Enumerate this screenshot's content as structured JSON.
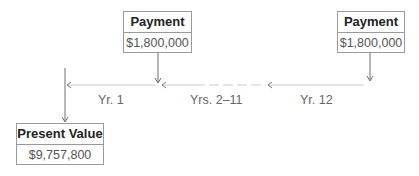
{
  "diagram": {
    "payment_left": {
      "title": "Payment",
      "value": "$1,800,000"
    },
    "payment_right": {
      "title": "Payment",
      "value": "$1,800,000"
    },
    "present_value": {
      "title": "Present Value",
      "value": "$9,757,800"
    },
    "timeline_labels": {
      "yr1": "Yr. 1",
      "yrs2_11": "Yrs. 2–11",
      "yr12": "Yr. 12"
    },
    "colors": {
      "border": "#9a9a9a",
      "line": "#8a8a8a",
      "text": "#222222",
      "label": "#666666"
    }
  }
}
